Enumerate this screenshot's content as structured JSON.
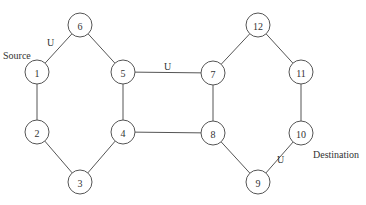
{
  "diagram": {
    "type": "network-graph",
    "node_radius": 12,
    "colors": {
      "stroke": "#555555",
      "text": "#333333",
      "background": "#ffffff"
    },
    "nodes": [
      {
        "id": "1",
        "label": "1",
        "x": 37,
        "y": 72
      },
      {
        "id": "2",
        "label": "2",
        "x": 37,
        "y": 132
      },
      {
        "id": "3",
        "label": "3",
        "x": 80,
        "y": 182
      },
      {
        "id": "4",
        "label": "4",
        "x": 123,
        "y": 132
      },
      {
        "id": "5",
        "label": "5",
        "x": 123,
        "y": 72
      },
      {
        "id": "6",
        "label": "6",
        "x": 80,
        "y": 25
      },
      {
        "id": "7",
        "label": "7",
        "x": 213,
        "y": 73
      },
      {
        "id": "8",
        "label": "8",
        "x": 213,
        "y": 133
      },
      {
        "id": "9",
        "label": "9",
        "x": 258,
        "y": 182
      },
      {
        "id": "10",
        "label": "10",
        "x": 301,
        "y": 133
      },
      {
        "id": "11",
        "label": "11",
        "x": 301,
        "y": 72
      },
      {
        "id": "12",
        "label": "12",
        "x": 258,
        "y": 25
      }
    ],
    "edges": [
      {
        "from": "1",
        "to": "6",
        "label": "U"
      },
      {
        "from": "6",
        "to": "5",
        "label": ""
      },
      {
        "from": "1",
        "to": "2",
        "label": ""
      },
      {
        "from": "2",
        "to": "3",
        "label": ""
      },
      {
        "from": "3",
        "to": "4",
        "label": ""
      },
      {
        "from": "4",
        "to": "5",
        "label": ""
      },
      {
        "from": "5",
        "to": "7",
        "label": "U"
      },
      {
        "from": "4",
        "to": "8",
        "label": ""
      },
      {
        "from": "7",
        "to": "8",
        "label": ""
      },
      {
        "from": "7",
        "to": "12",
        "label": ""
      },
      {
        "from": "12",
        "to": "11",
        "label": ""
      },
      {
        "from": "11",
        "to": "10",
        "label": ""
      },
      {
        "from": "8",
        "to": "9",
        "label": ""
      },
      {
        "from": "9",
        "to": "10",
        "label": "U"
      }
    ],
    "annotations": {
      "source": {
        "text": "Source",
        "node": "1"
      },
      "destination": {
        "text": "Destination",
        "node": "10"
      },
      "edge_labels": [
        {
          "text": "U",
          "x": 47,
          "y": 46
        },
        {
          "text": "U",
          "x": 167,
          "y": 70
        },
        {
          "text": "U",
          "x": 277,
          "y": 163
        }
      ]
    }
  }
}
